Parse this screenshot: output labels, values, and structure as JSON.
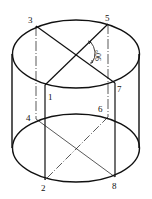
{
  "diagram": {
    "title": "",
    "points": [
      {
        "id": "1",
        "label": "1"
      },
      {
        "id": "2",
        "label": "2"
      },
      {
        "id": "3",
        "label": "3"
      },
      {
        "id": "4",
        "label": "4"
      },
      {
        "id": "5",
        "label": "5"
      },
      {
        "id": "6",
        "label": "6"
      },
      {
        "id": "7",
        "label": "7"
      },
      {
        "id": "8",
        "label": "8"
      }
    ],
    "angle_label": "90°",
    "colors": {
      "line": "#111111",
      "background": "#ffffff"
    }
  }
}
